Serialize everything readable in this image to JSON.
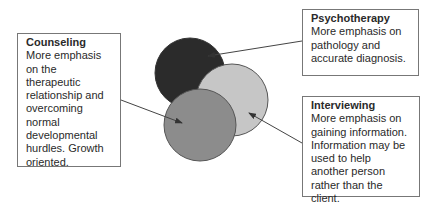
{
  "diagram": {
    "circles": [
      {
        "id": "psychotherapy",
        "color": "#2b2b2b",
        "cx": 190,
        "cy": 73,
        "r": 35
      },
      {
        "id": "interviewing",
        "color": "#c6c6c6",
        "cx": 232,
        "cy": 100,
        "r": 36
      },
      {
        "id": "counseling",
        "color": "#8c8c8c",
        "cx": 200,
        "cy": 125,
        "r": 36
      }
    ],
    "boxes": {
      "counseling": {
        "title": "Counseling",
        "body": "More emphasis on the therapeutic relationship and overcoming normal developmental hurdles. Growth oriented."
      },
      "psychotherapy": {
        "title": "Psychotherapy",
        "body": "More emphasis on pathology and accurate diagnosis."
      },
      "interviewing": {
        "title": "Interviewing",
        "body": "More emphasis on gaining information. Information may be used to help another person rather than the client."
      }
    },
    "connectors": [
      {
        "from": "psychotherapy-box",
        "to": "psychotherapy-circle"
      },
      {
        "from": "counseling-box",
        "to": "counseling-circle"
      },
      {
        "from": "interviewing-box",
        "to": "interviewing-circle"
      }
    ]
  }
}
